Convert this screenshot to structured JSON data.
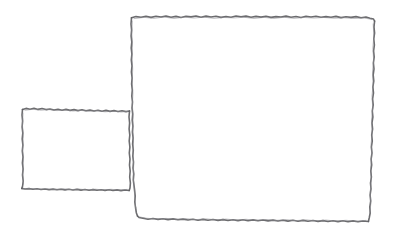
{
  "canvas": {
    "width": 402,
    "height": 242,
    "background_color": "#ffffff",
    "style": "hand-drawn-pencil-wireframe",
    "description": "Two overlapping hand-drawn rectangles forming a wireframe layout sketch"
  },
  "stroke": {
    "color": "#5f5f63",
    "secondary_color": "#8a8a8f",
    "width": 1.6,
    "texture": "rough-pencil"
  },
  "shapes": [
    {
      "name": "small-panel-rect",
      "role": "sidebar-panel",
      "x": 22,
      "y": 108,
      "width": 106,
      "height": 82,
      "fill": "none",
      "label": ""
    },
    {
      "name": "large-content-rect",
      "role": "main-content-area",
      "x": 131,
      "y": 16,
      "width": 244,
      "height": 206,
      "fill": "none",
      "label": ""
    }
  ]
}
